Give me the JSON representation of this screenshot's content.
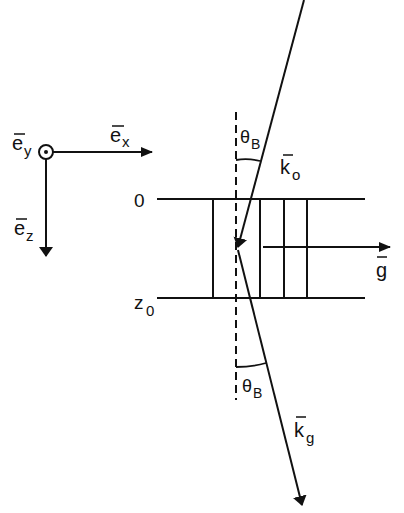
{
  "diagram": {
    "coordinate_axes": {
      "ex_label": "e",
      "ex_sub": "x",
      "ey_label": "e",
      "ey_sub": "y",
      "ez_label": "e",
      "ez_sub": "z"
    },
    "slab": {
      "top_label": "0",
      "bottom_label": "z",
      "bottom_sub": "0"
    },
    "vectors": {
      "incident_label": "k",
      "incident_sub": "o",
      "diffracted_label": "k",
      "diffracted_sub": "g",
      "reciprocal_label": "g"
    },
    "angles": {
      "top_label": "θ",
      "top_sub": "B",
      "bottom_label": "θ",
      "bottom_sub": "B"
    },
    "colors": {
      "ink": "#111111",
      "background": "#ffffff"
    }
  }
}
